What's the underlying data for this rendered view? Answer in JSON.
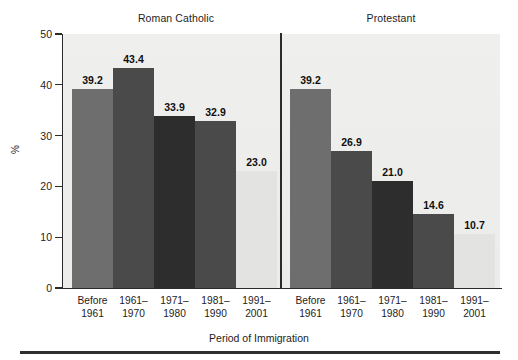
{
  "chart_data": {
    "type": "bar",
    "title": "",
    "xlabel": "Period of Immigration",
    "ylabel": "%",
    "ylim": [
      0,
      50
    ],
    "yticks": [
      0,
      10,
      20,
      30,
      40,
      50
    ],
    "ytick_labels": [
      "0",
      "10",
      "20",
      "30",
      "40",
      "50"
    ],
    "grid": false,
    "legend": "none",
    "panels": [
      {
        "name": "Roman Catholic",
        "categories": [
          "Before 1961",
          "1961–1970",
          "1971–1980",
          "1981–1990",
          "1991–2001"
        ],
        "category_lines": [
          [
            "Before",
            "1961"
          ],
          [
            "1961–",
            "1970"
          ],
          [
            "1971–",
            "1980"
          ],
          [
            "1981–",
            "1990"
          ],
          [
            "1991–",
            "2001"
          ]
        ],
        "values": [
          39.2,
          43.4,
          33.9,
          32.9,
          23.0
        ],
        "value_labels": [
          "39.2",
          "43.4",
          "33.9",
          "32.9",
          "23.0"
        ],
        "bar_colors": [
          "#6e6e6e",
          "#4a4a4a",
          "#2d2d2d",
          "#4a4a4a",
          "#e3e3e1"
        ]
      },
      {
        "name": "Protestant",
        "categories": [
          "Before 1961",
          "1961–1970",
          "1971–1980",
          "1981–1990",
          "1991–2001"
        ],
        "category_lines": [
          [
            "Before",
            "1961"
          ],
          [
            "1961–",
            "1970"
          ],
          [
            "1971–",
            "1980"
          ],
          [
            "1981–",
            "1990"
          ],
          [
            "1991–",
            "2001"
          ]
        ],
        "values": [
          39.2,
          26.9,
          21.0,
          14.6,
          10.7
        ],
        "value_labels": [
          "39.2",
          "26.9",
          "21.0",
          "14.6",
          "10.7"
        ],
        "bar_colors": [
          "#6e6e6e",
          "#4a4a4a",
          "#2d2d2d",
          "#4a4a4a",
          "#e3e3e1"
        ]
      }
    ]
  },
  "figure": {
    "plot_background": "#eeeeec",
    "axis_color": "#2b2b2b",
    "text_color": "#1d1d1d"
  }
}
